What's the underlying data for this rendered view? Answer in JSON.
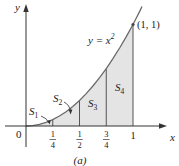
{
  "figure": {
    "caption": "(a)",
    "curve_label_lhs": "y = x",
    "curve_label_exp": "2",
    "point_label": "(1, 1)",
    "axes": {
      "x_label": "x",
      "y_label": "y",
      "origin_label": "0"
    },
    "x_ticks": [
      {
        "num": "1",
        "den": "4",
        "value": 0.25
      },
      {
        "num": "1",
        "den": "2",
        "value": 0.5
      },
      {
        "num": "3",
        "den": "4",
        "value": 0.75
      },
      {
        "label": "1",
        "value": 1
      }
    ],
    "regions": [
      {
        "name": "S",
        "sub": "1",
        "from": 0,
        "to": 0.25
      },
      {
        "name": "S",
        "sub": "2",
        "from": 0.25,
        "to": 0.5
      },
      {
        "name": "S",
        "sub": "3",
        "from": 0.5,
        "to": 0.75
      },
      {
        "name": "S",
        "sub": "4",
        "from": 0.75,
        "to": 1
      }
    ],
    "colors": {
      "shade": "#e4e4e4",
      "curve": "#6a6a6a",
      "axis": "#333333",
      "text": "#222222"
    }
  }
}
